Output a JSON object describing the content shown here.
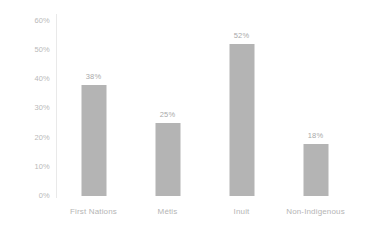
{
  "chart_data": {
    "type": "bar",
    "title": "",
    "subtitle": "",
    "xlabel": "",
    "ylabel": "",
    "categories": [
      "First Nations",
      "Métis",
      "Inuit",
      "Non-Indigenous"
    ],
    "values": [
      38,
      25,
      52,
      18
    ],
    "data_labels": [
      "38%",
      "25%",
      "52%",
      "18%"
    ],
    "ylim": [
      0,
      60
    ],
    "ytick_values": [
      0,
      10,
      20,
      30,
      40,
      50,
      60
    ],
    "ytick_labels": [
      "0%",
      "10%",
      "20%",
      "30%",
      "40%",
      "50%",
      "60%"
    ],
    "grid": false,
    "legend": null,
    "bar_color": "#b4b4b4",
    "axis_color": "#e9e9e9",
    "label_color": "#b5b5b5",
    "background_color": "#ffffff"
  }
}
